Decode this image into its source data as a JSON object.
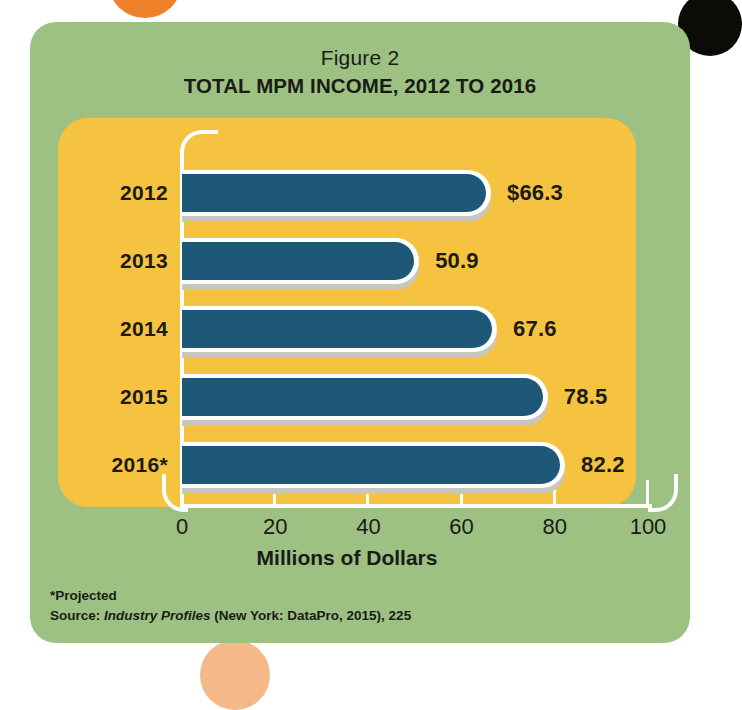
{
  "decor": {
    "orange_circle": "orange-circle",
    "black_circle": "black-circle"
  },
  "titles": {
    "figure_label": "Figure 2",
    "chart_title": "TOTAL MPM INCOME, 2012 TO 2016"
  },
  "footnotes": {
    "projected": "*Projected",
    "source_prefix": "Source: ",
    "source_italic": "Industry Profiles",
    "source_suffix": " (New York: DataPro, 2015), 225"
  },
  "colors": {
    "card_green": "#9cc183",
    "panel_yellow": "#f5c33f",
    "bar_blue": "#1d5878",
    "bar_outline": "#ffffff",
    "text_dark": "#1b1b16",
    "accent_orange": "#ed8028"
  },
  "chart_data": {
    "type": "bar",
    "orientation": "horizontal",
    "title": "TOTAL MPM INCOME, 2012 TO 2016",
    "subtitle": "Figure 2",
    "categories": [
      "2012",
      "2013",
      "2014",
      "2015",
      "2016*"
    ],
    "values": [
      66.3,
      50.9,
      67.6,
      78.5,
      82.2
    ],
    "value_labels": [
      "$66.3",
      "50.9",
      "67.6",
      "78.5",
      "82.2"
    ],
    "xlabel": "Millions of Dollars",
    "ylabel": "",
    "xlim": [
      0,
      100
    ],
    "xticks": [
      0,
      20,
      40,
      60,
      80,
      100
    ],
    "xtick_labels": [
      "0",
      "20",
      "40",
      "60",
      "80",
      "100"
    ],
    "grid": false,
    "legend": null,
    "series": [
      {
        "name": "Total MPM Income",
        "values": [
          66.3,
          50.9,
          67.6,
          78.5,
          82.2
        ]
      }
    ],
    "annotations": [
      "*Projected",
      "Source: Industry Profiles (New York: DataPro, 2015), 225"
    ]
  }
}
